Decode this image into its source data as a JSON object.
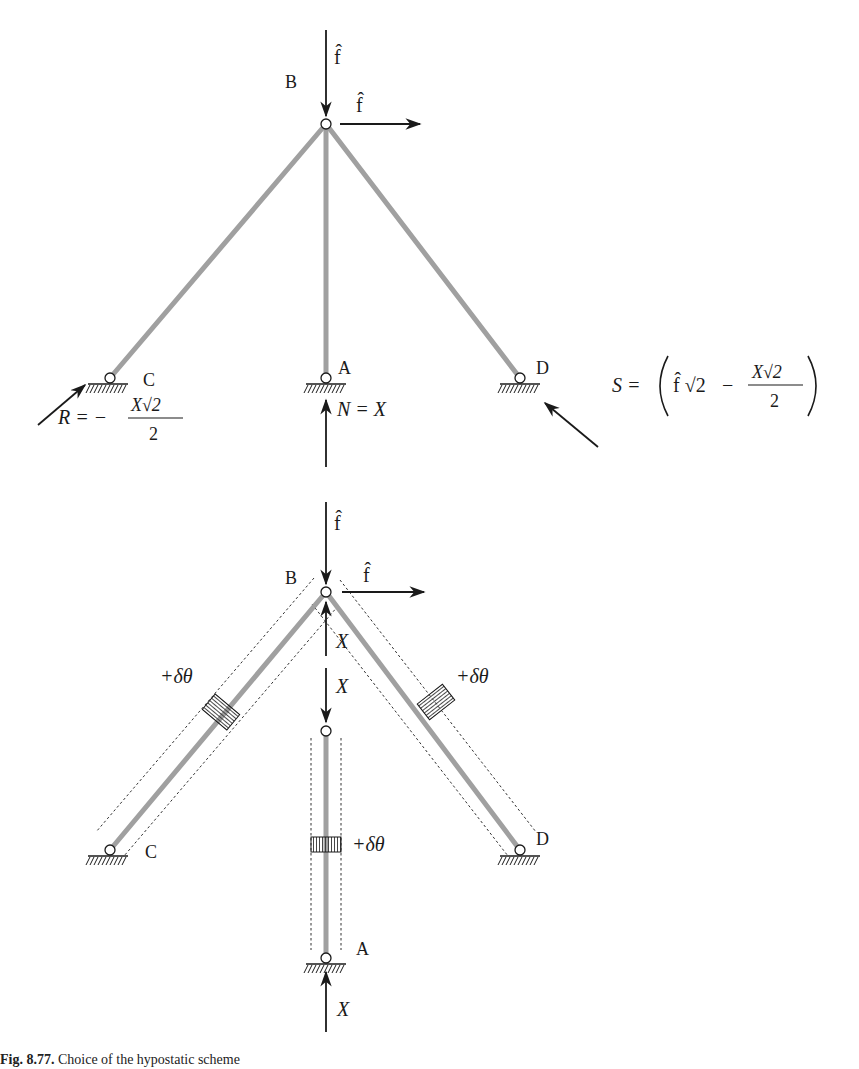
{
  "top_diagram": {
    "nodes": {
      "B": "B",
      "A": "A",
      "C": "C",
      "D": "D"
    },
    "loads": {
      "vertical": "f̂",
      "horizontal": "f̂"
    },
    "reactions": {
      "R": {
        "lhs": "R = −",
        "num": "X√2",
        "den": "2"
      },
      "N": {
        "text": "N = X"
      },
      "S": {
        "lhs": "S =",
        "f": "f̂ √2",
        "minus": "−",
        "num": "X√2",
        "den": "2"
      }
    }
  },
  "bottom_diagram": {
    "nodes": {
      "B": "B",
      "A": "A",
      "C": "C",
      "D": "D"
    },
    "loads": {
      "vertical": "f̂",
      "horizontal": "f̂"
    },
    "internal_forces": {
      "X_up": "X",
      "X_down": "X",
      "X_bottom": "X"
    },
    "rotations": {
      "left": "+δθ",
      "right": "+δθ",
      "center": "+δθ"
    }
  },
  "caption": {
    "label": "Fig. 8.77.",
    "text": "Choice of the hypostatic scheme"
  },
  "colors": {
    "rod": "#a0a0a0",
    "ink": "#1a1a1a",
    "background": "#ffffff"
  }
}
